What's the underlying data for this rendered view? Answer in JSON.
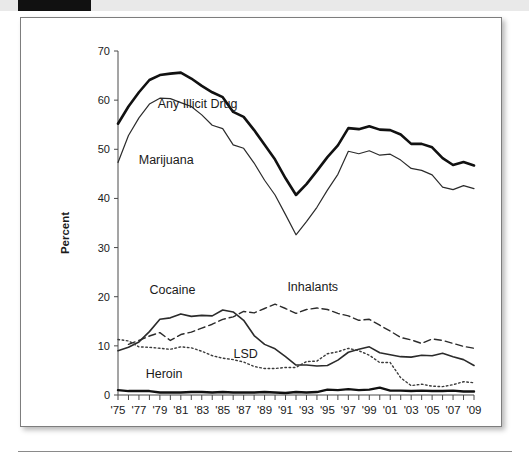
{
  "page": {
    "panel_name": "drug-use-trend-figure",
    "header_tab_color": "#111111",
    "band_color": "#e9e9e9",
    "panel_border_color": "#7d7d7d"
  },
  "chart_data": {
    "type": "line",
    "title": "",
    "xlabel": "",
    "ylabel": "Percent",
    "ylim": [
      0,
      70
    ],
    "yticks": [
      0,
      10,
      20,
      30,
      40,
      50,
      60,
      70
    ],
    "xlim": [
      1975,
      2009
    ],
    "grid": false,
    "legend": "inline-annotations",
    "x": [
      1975,
      1976,
      1977,
      1978,
      1979,
      1980,
      1981,
      1982,
      1983,
      1984,
      1985,
      1986,
      1987,
      1988,
      1989,
      1990,
      1991,
      1992,
      1993,
      1994,
      1995,
      1996,
      1997,
      1998,
      1999,
      2000,
      2001,
      2002,
      2003,
      2004,
      2005,
      2006,
      2007,
      2008,
      2009
    ],
    "xtick_labels": [
      "'75",
      "'77",
      "'79",
      "'81",
      "'83",
      "'85",
      "'87",
      "'89",
      "'91",
      "'93",
      "'95",
      "'97",
      "'99",
      "'01",
      "'03",
      "'05",
      "'07",
      "'09"
    ],
    "xtick_label_years": [
      1975,
      1977,
      1979,
      1981,
      1983,
      1985,
      1987,
      1989,
      1991,
      1993,
      1995,
      1997,
      1999,
      2001,
      2003,
      2005,
      2007,
      2009
    ],
    "series": [
      {
        "name": "Any Illicit Drug",
        "style": "solid-thick",
        "color": "#111111",
        "width": 2.6,
        "label_x": 1982.6,
        "label_y": 58.5,
        "values": [
          55.2,
          58.7,
          61.6,
          64.1,
          65.1,
          65.4,
          65.6,
          64.4,
          62.9,
          61.6,
          60.6,
          57.6,
          56.6,
          53.9,
          50.9,
          47.9,
          44.1,
          40.7,
          42.9,
          45.6,
          48.4,
          50.8,
          54.3,
          54.1,
          54.7,
          54.0,
          53.9,
          53.0,
          51.1,
          51.1,
          50.4,
          48.2,
          46.8,
          47.4,
          46.7
        ]
      },
      {
        "name": "Marijuana",
        "style": "solid-thin",
        "color": "#2b2b2b",
        "width": 1.2,
        "label_x": 1979.6,
        "label_y": 47.0,
        "values": [
          47.3,
          52.8,
          56.4,
          59.2,
          60.4,
          60.3,
          59.5,
          58.7,
          57.0,
          54.9,
          54.2,
          50.9,
          50.2,
          47.2,
          43.7,
          40.7,
          36.7,
          32.6,
          35.3,
          38.2,
          41.7,
          44.9,
          49.6,
          49.1,
          49.7,
          48.8,
          49.0,
          47.8,
          46.1,
          45.7,
          44.8,
          42.3,
          41.8,
          42.6,
          42.0
        ]
      },
      {
        "name": "Cocaine",
        "style": "solid-medium",
        "color": "#2b2b2b",
        "width": 1.6,
        "label_x": 1980.2,
        "label_y": 20.6,
        "values": [
          9.0,
          9.7,
          10.8,
          12.9,
          15.4,
          15.7,
          16.5,
          16.0,
          16.2,
          16.1,
          17.3,
          16.9,
          15.2,
          12.1,
          10.3,
          9.4,
          7.8,
          6.1,
          6.1,
          5.9,
          6.0,
          7.1,
          8.7,
          9.3,
          9.8,
          8.6,
          8.2,
          7.8,
          7.7,
          8.1,
          8.0,
          8.5,
          7.8,
          7.2,
          6.0
        ]
      },
      {
        "name": "Inhalants",
        "style": "dashed",
        "color": "#2b2b2b",
        "width": 1.4,
        "label_x": 1993.6,
        "label_y": 21.2,
        "values": [
          null,
          10.3,
          11.1,
          12.0,
          12.7,
          11.1,
          12.3,
          12.8,
          13.6,
          14.4,
          15.4,
          15.9,
          17.0,
          16.7,
          17.6,
          18.5,
          17.6,
          16.6,
          17.4,
          17.7,
          17.4,
          16.6,
          16.1,
          15.2,
          15.4,
          14.2,
          13.0,
          11.7,
          11.2,
          10.5,
          11.4,
          11.1,
          10.5,
          9.9,
          9.5
        ]
      },
      {
        "name": "LSD",
        "style": "dotted",
        "color": "#3b3b3b",
        "width": 1.4,
        "label_x": 1987.2,
        "label_y": 7.6,
        "values": [
          11.3,
          11.0,
          9.8,
          9.7,
          9.5,
          9.3,
          9.8,
          9.6,
          8.9,
          8.0,
          7.5,
          7.2,
          6.7,
          5.8,
          5.4,
          5.4,
          5.6,
          5.6,
          6.8,
          6.9,
          8.4,
          8.8,
          9.5,
          9.0,
          8.1,
          6.6,
          6.6,
          3.5,
          1.9,
          2.2,
          1.8,
          1.7,
          2.1,
          2.7,
          2.5
        ]
      },
      {
        "name": "Heroin",
        "style": "solid-thick",
        "color": "#111111",
        "width": 2.4,
        "label_x": 1979.4,
        "label_y": 3.4,
        "values": [
          1.0,
          0.8,
          0.8,
          0.8,
          0.5,
          0.5,
          0.5,
          0.6,
          0.6,
          0.5,
          0.6,
          0.5,
          0.5,
          0.5,
          0.6,
          0.5,
          0.4,
          0.6,
          0.5,
          0.6,
          1.1,
          1.0,
          1.2,
          1.0,
          1.1,
          1.5,
          0.9,
          0.9,
          0.8,
          0.9,
          0.8,
          0.8,
          0.9,
          0.7,
          0.7
        ]
      }
    ]
  }
}
